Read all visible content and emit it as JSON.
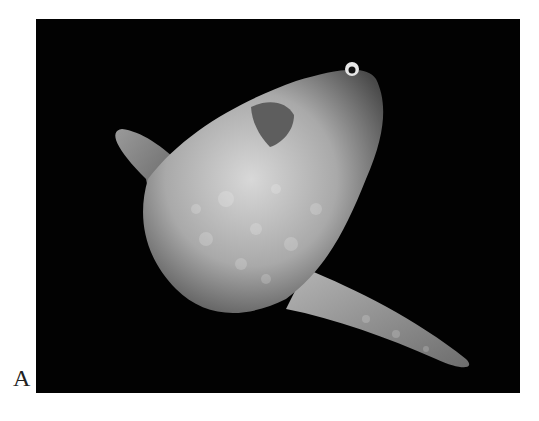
{
  "figure": {
    "panel_label": "A",
    "background_color": "#020202"
  }
}
